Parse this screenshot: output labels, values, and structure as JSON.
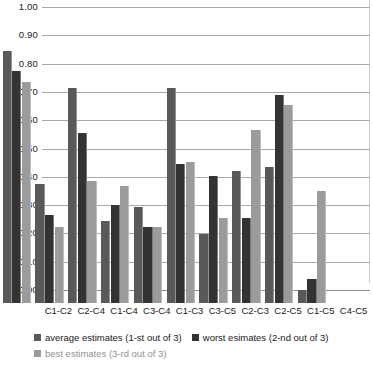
{
  "chart_data": {
    "type": "bar",
    "title": "",
    "xlabel": "",
    "ylabel": "",
    "ylim": [
      0.0,
      1.0
    ],
    "grid": true,
    "legend_position": "bottom",
    "categories": [
      "C1-C2",
      "C2-C4",
      "C1-C4",
      "C3-C4",
      "C1-C3",
      "C3-C5",
      "C2-C3",
      "C2-C5",
      "C1-C5",
      "C4-C5"
    ],
    "y_ticks": [
      "0.00",
      "0.10",
      "0.20",
      "0.30",
      "0.40",
      "0.50",
      "0.60",
      "0.70",
      "0.80",
      "0.90",
      "1.00"
    ],
    "series": [
      {
        "name": "average estimates (1-st out of 3)",
        "color": "#595959",
        "values": [
          0.89,
          0.42,
          0.76,
          0.29,
          0.34,
          0.76,
          0.245,
          0.465,
          0.48,
          0.045
        ]
      },
      {
        "name": "worst esimates (2-nd out of 3)",
        "color": "#333333",
        "values": [
          0.82,
          0.31,
          0.6,
          0.345,
          0.27,
          0.49,
          0.45,
          0.3,
          0.735,
          0.085
        ]
      },
      {
        "name": "best estimates (3-rd out of 3)",
        "color": "#9b9b9b",
        "values": [
          0.78,
          0.27,
          0.43,
          0.415,
          0.27,
          0.5,
          0.3,
          0.61,
          0.7,
          0.395
        ]
      }
    ]
  },
  "legend": {
    "items": [
      {
        "label": "average estimates (1-st out of 3)",
        "swatch": "s1"
      },
      {
        "label": "worst esimates (2-nd out of 3)",
        "swatch": "s2"
      },
      {
        "label": "best estimates (3-rd out of 3)",
        "swatch": "s3"
      }
    ]
  }
}
